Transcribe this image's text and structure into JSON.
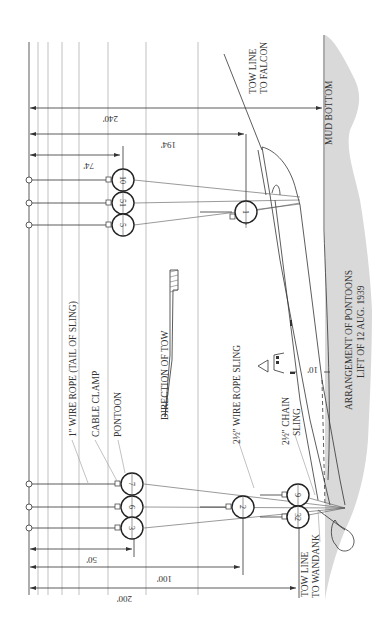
{
  "title": {
    "line1": "ARRANGEMENT OF PONTOONS",
    "line2": "LIFT OF 12 AUG. 1939"
  },
  "labels": {
    "wire_rope_tail": "1\" WIRE ROPE (TAIL OF SLING)",
    "cable_clamp": "CABLE CLAMP",
    "pontoon": "PONTOON",
    "direction_of_tow": "DIRECTION OF TOW",
    "wire_rope_sling": "2½\" WIRE ROPE SLING",
    "chain_sling_1": "2½\" CHAIN",
    "chain_sling_2": "SLING",
    "mud_bottom": "MUD BOTTOM",
    "tow_line_falcon_1": "TOW LINE",
    "tow_line_falcon_2": "TO FALCON",
    "tow_line_wandank_1": "TOW LINE",
    "tow_line_wandank_2": "TO WANDANK",
    "offset": "10'"
  },
  "dimensions": {
    "d240": "240'",
    "d194": "194'",
    "d74": "74'",
    "d50": "50'",
    "d100": "100'",
    "d200": "200'"
  },
  "pontoons": {
    "p10": "10",
    "p51": "51",
    "p5": "5",
    "p1": "1",
    "p7": "7",
    "p6": "6",
    "p3": "3",
    "p2": "2",
    "p9": "9",
    "p32": "32"
  },
  "colors": {
    "mud": "#d9d9d9",
    "line": "#333333"
  }
}
